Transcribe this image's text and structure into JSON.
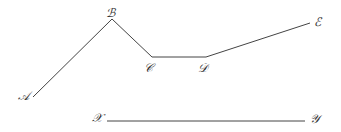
{
  "diagram": {
    "polyline_labels": {
      "A": "𝒜",
      "B": "ℬ",
      "C": "𝒞",
      "D": "𝒟",
      "E": "ℰ"
    },
    "segment_labels": {
      "X": "𝒳",
      "Y": "𝒴"
    },
    "points": [
      {
        "name": "A",
        "x": 33,
        "y": 97
      },
      {
        "name": "B",
        "x": 112,
        "y": 19
      },
      {
        "name": "C",
        "x": 152,
        "y": 57
      },
      {
        "name": "D",
        "x": 206,
        "y": 57
      },
      {
        "name": "E",
        "x": 310,
        "y": 23
      }
    ],
    "segment": {
      "from": {
        "name": "X",
        "x": 107,
        "y": 121
      },
      "to": {
        "name": "Y",
        "x": 305,
        "y": 121
      }
    },
    "line_color": "#444444"
  }
}
